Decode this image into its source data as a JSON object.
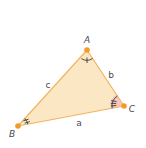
{
  "diagram": {
    "type": "triangle",
    "colors": {
      "fill": "#fbe7c3",
      "edge": "#f0b462",
      "vertex": "#f39a2a",
      "arc": "#3a3a3a",
      "angle_c_tint": "#f4b8b8",
      "label": "#4a4a52"
    },
    "vertices": [
      {
        "id": "A",
        "label": "A",
        "x": 87,
        "y": 50,
        "label_x": 87,
        "label_y": 43
      },
      {
        "id": "B",
        "label": "B",
        "x": 18,
        "y": 126,
        "label_x": 12,
        "label_y": 137
      },
      {
        "id": "C",
        "label": "C",
        "x": 124,
        "y": 106,
        "label_x": 132,
        "label_y": 112
      }
    ],
    "sides": [
      {
        "id": "a",
        "label": "a",
        "from": "B",
        "to": "C",
        "label_x": 79,
        "label_y": 126
      },
      {
        "id": "b",
        "label": "b",
        "from": "A",
        "to": "C",
        "label_x": 111,
        "label_y": 78
      },
      {
        "id": "c",
        "label": "c",
        "from": "A",
        "to": "B",
        "label_x": 48,
        "label_y": 88
      }
    ],
    "angle_marks": [
      {
        "vertex": "A",
        "arcs": 1,
        "ticks": 1
      },
      {
        "vertex": "B",
        "arcs": 1,
        "ticks": 2
      },
      {
        "vertex": "C",
        "arcs": 1,
        "ticks": 3
      }
    ]
  }
}
